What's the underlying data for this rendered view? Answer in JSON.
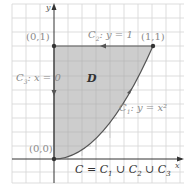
{
  "figure": {
    "type": "region-boundary-diagram",
    "axes": {
      "x_label": "x",
      "y_label": "y"
    },
    "region_label": "D",
    "points": [
      {
        "label": "(0,0)",
        "x": 0,
        "y": 0
      },
      {
        "label": "(0,1)",
        "x": 0,
        "y": 1
      },
      {
        "label": "(1,1)",
        "x": 1,
        "y": 1
      }
    ],
    "curves": [
      {
        "name": "C1",
        "label_main": "C",
        "label_sub": "1",
        "label_rest": ": y = x²",
        "equation": "y = x^2",
        "direction": "from (0,0) to (1,1)"
      },
      {
        "name": "C2",
        "label_main": "C",
        "label_sub": "2",
        "label_rest": ": y = 1",
        "equation": "y = 1",
        "direction": "from (1,1) to (0,1)"
      },
      {
        "name": "C3",
        "label_main": "C",
        "label_sub": "3",
        "label_rest": ": x = 0",
        "equation": "x = 0",
        "direction": "from (0,1) to (0,0)"
      }
    ],
    "union_label": {
      "lhs": "C = C",
      "s1": "1",
      "u1": " ∪ C",
      "s2": "2",
      "u2": " ∪ C",
      "s3": "3"
    },
    "colors": {
      "region_fill": "#c8c8c8",
      "grid": "#d4d4d4",
      "axis": "#333333",
      "boundary": "#555555",
      "label_gray": "#8a8a8a"
    }
  }
}
